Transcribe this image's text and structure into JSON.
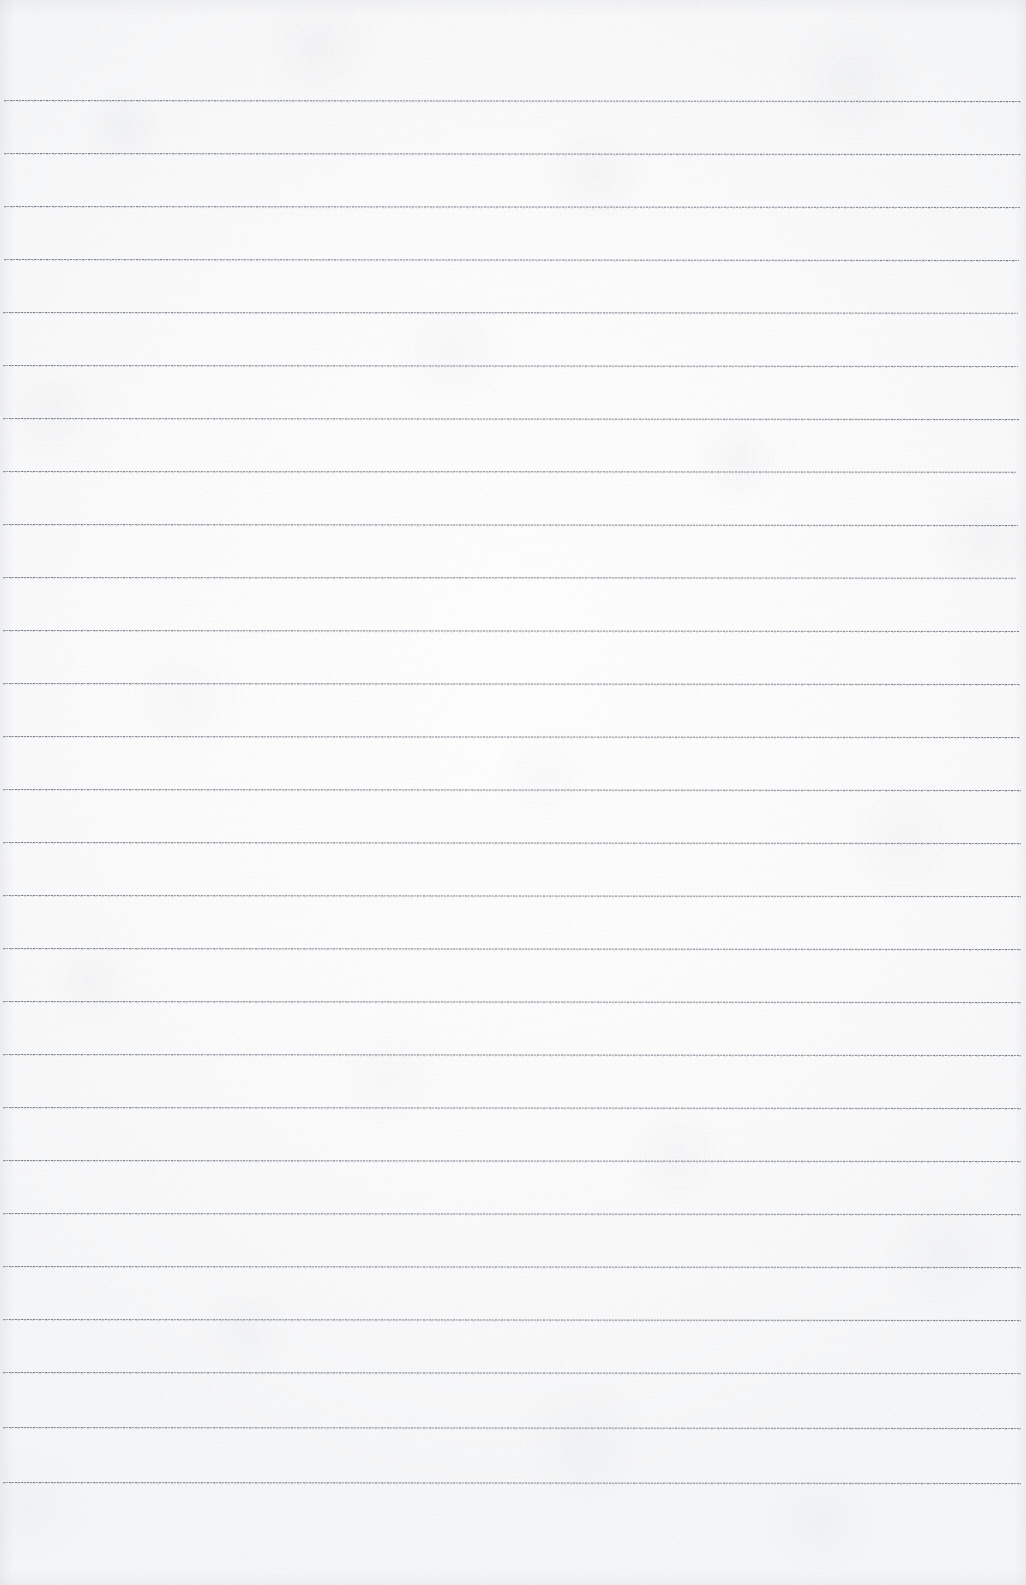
{
  "document": {
    "kind": "blank-ruled-notebook-page",
    "title": "",
    "body_text": "",
    "visible_text_count": 0
  },
  "page": {
    "width": 1026,
    "height": 1585,
    "paper_color": "#fbfbfc",
    "paper_highlight_color": "#ffffff",
    "paper_shadow_color": "#f3f4f6"
  },
  "ruling": {
    "line_color": "#6c727c",
    "line_secondary_color": "#a0a6af",
    "line_style": "dotted-fine",
    "line_thickness_px": 1,
    "line_spacing_px": 53,
    "first_line_y": 100,
    "last_line_y": 1482,
    "left_inset_px": 4,
    "right_inset_px": 7,
    "count": 27,
    "lines": [
      {
        "y": 100,
        "x1": 4,
        "x2": 1021,
        "tilt_deg": 0.06
      },
      {
        "y": 153,
        "x1": 4,
        "x2": 1021,
        "tilt_deg": 0.05
      },
      {
        "y": 206,
        "x1": 4,
        "x2": 1020,
        "tilt_deg": 0.06
      },
      {
        "y": 259,
        "x1": 4,
        "x2": 1019,
        "tilt_deg": 0.05
      },
      {
        "y": 312,
        "x1": 3,
        "x2": 1018,
        "tilt_deg": 0.04
      },
      {
        "y": 365,
        "x1": 3,
        "x2": 1018,
        "tilt_deg": 0.05
      },
      {
        "y": 418,
        "x1": 3,
        "x2": 1019,
        "tilt_deg": 0.06
      },
      {
        "y": 471,
        "x1": 3,
        "x2": 1017,
        "tilt_deg": 0.04
      },
      {
        "y": 524,
        "x1": 3,
        "x2": 1018,
        "tilt_deg": 0.05
      },
      {
        "y": 577,
        "x1": 3,
        "x2": 1016,
        "tilt_deg": 0.04
      },
      {
        "y": 630,
        "x1": 3,
        "x2": 1019,
        "tilt_deg": 0.06
      },
      {
        "y": 683,
        "x1": 3,
        "x2": 1020,
        "tilt_deg": 0.05
      },
      {
        "y": 736,
        "x1": 3,
        "x2": 1020,
        "tilt_deg": 0.05
      },
      {
        "y": 789,
        "x1": 3,
        "x2": 1021,
        "tilt_deg": 0.06
      },
      {
        "y": 842,
        "x1": 3,
        "x2": 1021,
        "tilt_deg": 0.05
      },
      {
        "y": 895,
        "x1": 3,
        "x2": 1021,
        "tilt_deg": 0.05
      },
      {
        "y": 948,
        "x1": 3,
        "x2": 1021,
        "tilt_deg": 0.06
      },
      {
        "y": 1001,
        "x1": 3,
        "x2": 1021,
        "tilt_deg": 0.05
      },
      {
        "y": 1054,
        "x1": 3,
        "x2": 1021,
        "tilt_deg": 0.05
      },
      {
        "y": 1107,
        "x1": 3,
        "x2": 1021,
        "tilt_deg": 0.06
      },
      {
        "y": 1160,
        "x1": 3,
        "x2": 1021,
        "tilt_deg": 0.05
      },
      {
        "y": 1213,
        "x1": 3,
        "x2": 1021,
        "tilt_deg": 0.06
      },
      {
        "y": 1266,
        "x1": 3,
        "x2": 1021,
        "tilt_deg": 0.05
      },
      {
        "y": 1319,
        "x1": 3,
        "x2": 1021,
        "tilt_deg": 0.06
      },
      {
        "y": 1372,
        "x1": 3,
        "x2": 1021,
        "tilt_deg": 0.05
      },
      {
        "y": 1427,
        "x1": 3,
        "x2": 1021,
        "tilt_deg": 0.06
      },
      {
        "y": 1482,
        "x1": 3,
        "x2": 1021,
        "tilt_deg": 0.05
      }
    ]
  },
  "margins": {
    "top_blank_band_px": 100,
    "bottom_blank_band_px": 103,
    "vertical_margin_rule": false
  }
}
